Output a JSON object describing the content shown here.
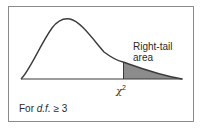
{
  "diagram": {
    "tail_label_line1": "Right-tail",
    "tail_label_line2": "area",
    "critical_value_symbol": "χ",
    "critical_value_exponent": "2",
    "df_prefix": "For ",
    "df_var": "d.f.",
    "df_condition": " ≥ 3",
    "colors": {
      "curve": "#3a3a3a",
      "shade": "#8c8c8c",
      "frame": "#8a8a8a",
      "background": "#ffffff"
    }
  }
}
